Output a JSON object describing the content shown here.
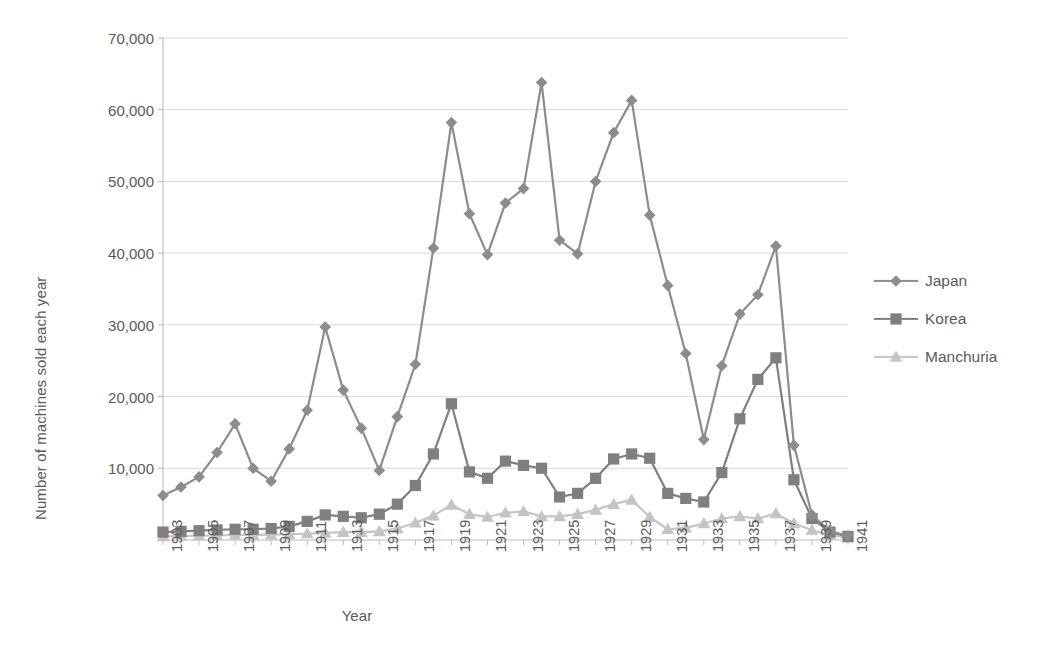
{
  "chart_data": {
    "type": "line",
    "title": "",
    "xlabel": "Year",
    "ylabel": "Number of machines sold each year",
    "xlim": [
      1903,
      1941
    ],
    "ylim": [
      0,
      70000
    ],
    "ytick_labels": [
      "70,000",
      "60,000",
      "50,000",
      "40,000",
      "30,000",
      "20,000",
      "10,000"
    ],
    "ytick_values": [
      70000,
      60000,
      50000,
      40000,
      30000,
      20000,
      10000
    ],
    "grid": true,
    "legend_position": "right",
    "x": [
      1903,
      1904,
      1905,
      1906,
      1907,
      1908,
      1909,
      1910,
      1911,
      1912,
      1913,
      1914,
      1915,
      1916,
      1917,
      1918,
      1919,
      1920,
      1921,
      1922,
      1923,
      1924,
      1925,
      1926,
      1927,
      1928,
      1929,
      1930,
      1931,
      1932,
      1933,
      1934,
      1935,
      1936,
      1937,
      1938,
      1939,
      1940,
      1941
    ],
    "xtick_labels": [
      "1903",
      "1905",
      "1907",
      "1909",
      "1911",
      "1913",
      "1915",
      "1917",
      "1919",
      "1921",
      "1923",
      "1925",
      "1927",
      "1929",
      "1931",
      "1933",
      "1935",
      "1937",
      "1939",
      "1941"
    ],
    "series": [
      {
        "name": "Japan",
        "marker": "diamond",
        "color": "#8c8c8c",
        "values": [
          6200,
          7400,
          8800,
          12200,
          16200,
          10000,
          8200,
          12700,
          18100,
          29700,
          20900,
          15600,
          9700,
          17200,
          24500,
          40700,
          58200,
          45500,
          39800,
          47000,
          49000,
          63800,
          41800,
          39900,
          50000,
          56800,
          61300,
          45300,
          35500,
          26000,
          14000,
          24300,
          31500,
          34200,
          41000,
          13200,
          3500,
          1200,
          600
        ]
      },
      {
        "name": "Korea",
        "marker": "square",
        "color": "#7f7f7f",
        "values": [
          1100,
          1200,
          1300,
          1400,
          1500,
          1500,
          1600,
          1900,
          2600,
          3500,
          3300,
          3100,
          3600,
          5000,
          7600,
          12000,
          19000,
          9500,
          8600,
          11000,
          10400,
          10000,
          6000,
          6500,
          8600,
          11300,
          12000,
          11400,
          6500,
          5800,
          5300,
          9400,
          16900,
          22400,
          25400,
          8400,
          3000,
          1100,
          500
        ]
      },
      {
        "name": "Manchuria",
        "marker": "triangle",
        "color": "#c4c4c4",
        "values": [
          500,
          550,
          600,
          650,
          700,
          700,
          750,
          800,
          900,
          1000,
          1100,
          1100,
          1200,
          1600,
          2400,
          3400,
          4900,
          3600,
          3200,
          3800,
          4000,
          3300,
          3300,
          3600,
          4200,
          5000,
          5600,
          3200,
          1500,
          1700,
          2300,
          3000,
          3300,
          3000,
          3700,
          2300,
          1400,
          700,
          300
        ]
      }
    ]
  },
  "legend": {
    "items": [
      {
        "label": "Japan"
      },
      {
        "label": "Korea"
      },
      {
        "label": "Manchuria"
      }
    ]
  },
  "axes": {
    "x_title": "Year",
    "y_title": "Number of machines sold each year"
  }
}
